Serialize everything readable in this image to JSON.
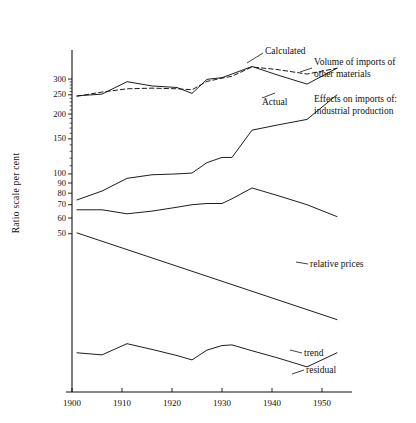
{
  "chart_data": {
    "type": "line",
    "title": "",
    "xlabel": "",
    "ylabel": "Ratio scale  per cent",
    "scale": "log",
    "grid": false,
    "legend_position": "inline-annotations",
    "xlim": [
      1900,
      1956
    ],
    "ylim": [
      8,
      420
    ],
    "xticks": [
      1900,
      1910,
      1920,
      1930,
      1940,
      1950
    ],
    "xtick_labels": [
      "1900",
      "1910",
      "1920",
      "1930",
      "1940",
      "1950"
    ],
    "yticks": [
      50,
      60,
      70,
      80,
      90,
      100,
      150,
      200,
      250,
      300
    ],
    "ytick_labels": [
      "50",
      "60",
      "70",
      "80",
      "90",
      "100",
      "150",
      "200",
      "250",
      "300"
    ],
    "minor_yticks": [
      110,
      120,
      130,
      140,
      160,
      170,
      180,
      190,
      210,
      220,
      230,
      240,
      260,
      270,
      280,
      290
    ],
    "series": [
      {
        "name": "Calculated",
        "style": "dashed",
        "label": "Calculated",
        "x": [
          1901,
          1906,
          1911,
          1916,
          1921,
          1924,
          1927,
          1930,
          1932,
          1936,
          1941,
          1947,
          1953
        ],
        "values": [
          246,
          258,
          268,
          270,
          268,
          265,
          292,
          303,
          310,
          345,
          335,
          318,
          340
        ]
      },
      {
        "name": "Actual",
        "style": "solid",
        "label": "Actual",
        "x": [
          1901,
          1906,
          1911,
          1916,
          1921,
          1924,
          1927,
          1930,
          1932,
          1936,
          1941,
          1947,
          1953
        ],
        "values": [
          247,
          252,
          291,
          277,
          272,
          254,
          299,
          305,
          318,
          347,
          315,
          283,
          340
        ]
      },
      {
        "name": "industrial production",
        "style": "solid",
        "label": "Effects on imports of:\nindustrial production",
        "x": [
          1901,
          1906,
          1911,
          1916,
          1921,
          1924,
          1927,
          1930,
          1932,
          1936,
          1941,
          1947,
          1953
        ],
        "values": [
          74,
          82,
          95,
          99,
          100,
          101,
          114,
          121,
          121,
          166,
          176,
          188,
          250
        ]
      },
      {
        "name": "relative prices",
        "style": "solid",
        "label": "relative prices",
        "x": [
          1901,
          1906,
          1911,
          1916,
          1921,
          1924,
          1927,
          1930,
          1932,
          1936,
          1941,
          1947,
          1953
        ],
        "values": [
          66,
          66,
          63,
          65,
          68,
          70,
          71,
          71,
          75,
          85,
          78,
          70,
          61
        ]
      },
      {
        "name": "trend",
        "style": "solid",
        "label": "trend",
        "x": [
          1901,
          1953
        ],
        "values": [
          50.5,
          18.5
        ]
      },
      {
        "name": "residual",
        "style": "solid",
        "label": "residual",
        "x": [
          1901,
          1906,
          1911,
          1916,
          1921,
          1924,
          1927,
          1930,
          1932,
          1936,
          1941,
          1947,
          1953
        ],
        "values": [
          12.6,
          12.3,
          14.0,
          13.1,
          12.2,
          11.6,
          13.0,
          13.7,
          13.8,
          12.9,
          11.9,
          10.7,
          12.6
        ]
      }
    ],
    "annotations": [
      {
        "name": "calculated-label",
        "text": "Calculated",
        "x": 1941,
        "y": 370
      },
      {
        "name": "actual-label",
        "text": "Actual",
        "x": 1941,
        "y": 286
      },
      {
        "name": "volume-label",
        "text": "Volume of imports of\nother materials",
        "x": 1954,
        "y": 350
      },
      {
        "name": "effects-label",
        "text": "Effects on imports of:\nindustrial production",
        "x": 1954,
        "y": 282
      },
      {
        "name": "relative-prices-label",
        "text": "relative prices",
        "x": 1955,
        "y": 61
      },
      {
        "name": "trend-label",
        "text": "trend",
        "x": 1955,
        "y": 18.5
      },
      {
        "name": "residual-label",
        "text": "residual",
        "x": 1955,
        "y": 13.5
      }
    ]
  },
  "axis": {
    "y_title": "Ratio scale  per cent",
    "y_labels": [
      "300",
      "250",
      "200",
      "150",
      "100",
      "90",
      "80",
      "70",
      "60",
      "50"
    ],
    "x_labels": [
      "1900",
      "1910",
      "1920",
      "1930",
      "1940",
      "1950"
    ]
  },
  "labels": {
    "calculated": "Calculated",
    "actual": "Actual",
    "volume_line1": "Volume of imports of",
    "volume_line2": "other materials",
    "effects_line1": "Effects on imports of:",
    "effects_line2": "industrial  production",
    "relative_prices": "relative prices",
    "trend": "trend",
    "residual": "residual"
  },
  "colors": {
    "ink": "#111111",
    "background": "#ffffff"
  }
}
